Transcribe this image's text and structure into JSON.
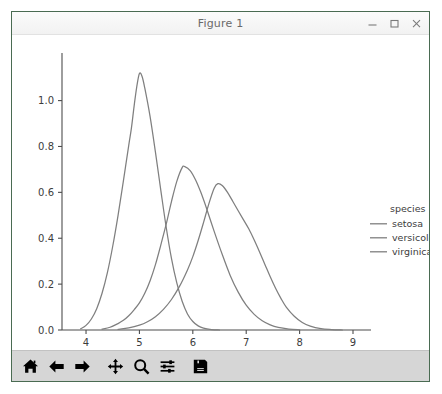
{
  "window": {
    "title": "Figure 1",
    "controls": [
      {
        "name": "minimize-button",
        "icon": "minimize-icon",
        "label": "–"
      },
      {
        "name": "maximize-button",
        "icon": "maximize-icon",
        "label": "□"
      },
      {
        "name": "close-button",
        "icon": "close-icon",
        "label": "×"
      }
    ]
  },
  "toolbar": {
    "buttons": [
      {
        "name": "home-button",
        "icon": "home-icon",
        "label": "Home"
      },
      {
        "name": "back-button",
        "icon": "arrow-left-icon",
        "label": "Back"
      },
      {
        "name": "forward-button",
        "icon": "arrow-right-icon",
        "label": "Forward"
      },
      {
        "name": "pan-button",
        "icon": "move-arrows-icon",
        "label": "Pan"
      },
      {
        "name": "zoom-button",
        "icon": "magnifier-icon",
        "label": "Zoom"
      },
      {
        "name": "configure-subplots-button",
        "icon": "sliders-icon",
        "label": "Configure subplots"
      },
      {
        "name": "save-button",
        "icon": "floppy-disk-icon",
        "label": "Save"
      }
    ]
  },
  "colors": {
    "curve": "#7f7f7f",
    "axis": "#4d4d4d",
    "text": "#3c3c3c",
    "window_border": "#4a6b52",
    "toolbar_bg": "#d6d6d6",
    "figure_bg": "#ffffff"
  },
  "chart_data": {
    "type": "line",
    "title": "",
    "xlabel": "sepal_length",
    "ylabel": "",
    "xlim": [
      3.55,
      9.0
    ],
    "ylim": [
      0.0,
      1.19
    ],
    "xticks": [
      4,
      5,
      6,
      7,
      8,
      9
    ],
    "xticklabels": [
      "4",
      "5",
      "6",
      "7",
      "8",
      "9"
    ],
    "yticks": [
      0.0,
      0.2,
      0.4,
      0.6,
      0.8,
      1.0
    ],
    "yticklabels": [
      "0.0",
      "0.2",
      "0.4",
      "0.6",
      "0.8",
      "1.0"
    ],
    "grid": false,
    "legend": {
      "title": "species",
      "position": "right",
      "entries": [
        "setosa",
        "versicolor",
        "virginica"
      ]
    },
    "series": [
      {
        "name": "setosa",
        "peak_x": 5.0,
        "peak_y": 1.12,
        "points": [
          [
            3.9,
            0.005
          ],
          [
            4.0,
            0.02
          ],
          [
            4.1,
            0.048
          ],
          [
            4.2,
            0.093
          ],
          [
            4.3,
            0.16
          ],
          [
            4.4,
            0.25
          ],
          [
            4.5,
            0.365
          ],
          [
            4.6,
            0.5
          ],
          [
            4.7,
            0.65
          ],
          [
            4.8,
            0.805
          ],
          [
            4.85,
            0.88
          ],
          [
            4.9,
            0.975
          ],
          [
            4.95,
            1.06
          ],
          [
            5.0,
            1.118
          ],
          [
            5.05,
            1.105
          ],
          [
            5.1,
            1.055
          ],
          [
            5.2,
            0.93
          ],
          [
            5.3,
            0.775
          ],
          [
            5.4,
            0.61
          ],
          [
            5.5,
            0.45
          ],
          [
            5.6,
            0.312
          ],
          [
            5.7,
            0.205
          ],
          [
            5.8,
            0.125
          ],
          [
            5.9,
            0.07
          ],
          [
            6.0,
            0.037
          ],
          [
            6.1,
            0.018
          ],
          [
            6.2,
            0.008
          ],
          [
            6.35,
            0.002
          ],
          [
            6.5,
            0.0
          ]
        ]
      },
      {
        "name": "versicolor",
        "peak_x": 5.82,
        "peak_y": 0.712,
        "points": [
          [
            4.3,
            0.004
          ],
          [
            4.45,
            0.012
          ],
          [
            4.6,
            0.028
          ],
          [
            4.7,
            0.042
          ],
          [
            4.8,
            0.062
          ],
          [
            4.9,
            0.088
          ],
          [
            5.0,
            0.118
          ],
          [
            5.1,
            0.16
          ],
          [
            5.2,
            0.215
          ],
          [
            5.3,
            0.285
          ],
          [
            5.4,
            0.37
          ],
          [
            5.5,
            0.46
          ],
          [
            5.6,
            0.56
          ],
          [
            5.7,
            0.648
          ],
          [
            5.8,
            0.708
          ],
          [
            5.85,
            0.712
          ],
          [
            5.95,
            0.695
          ],
          [
            6.05,
            0.655
          ],
          [
            6.15,
            0.6
          ],
          [
            6.25,
            0.535
          ],
          [
            6.4,
            0.43
          ],
          [
            6.55,
            0.33
          ],
          [
            6.7,
            0.238
          ],
          [
            6.85,
            0.165
          ],
          [
            7.0,
            0.108
          ],
          [
            7.15,
            0.068
          ],
          [
            7.3,
            0.04
          ],
          [
            7.45,
            0.022
          ],
          [
            7.6,
            0.011
          ],
          [
            7.8,
            0.004
          ],
          [
            8.0,
            0.001
          ]
        ]
      },
      {
        "name": "virginica",
        "peak_x": 6.45,
        "peak_y": 0.638,
        "points": [
          [
            4.6,
            0.003
          ],
          [
            4.8,
            0.009
          ],
          [
            5.0,
            0.021
          ],
          [
            5.15,
            0.036
          ],
          [
            5.3,
            0.058
          ],
          [
            5.45,
            0.09
          ],
          [
            5.6,
            0.133
          ],
          [
            5.75,
            0.19
          ],
          [
            5.9,
            0.262
          ],
          [
            6.0,
            0.32
          ],
          [
            6.1,
            0.39
          ],
          [
            6.2,
            0.468
          ],
          [
            6.3,
            0.55
          ],
          [
            6.4,
            0.618
          ],
          [
            6.47,
            0.638
          ],
          [
            6.55,
            0.63
          ],
          [
            6.65,
            0.6
          ],
          [
            6.75,
            0.56
          ],
          [
            6.85,
            0.52
          ],
          [
            6.95,
            0.48
          ],
          [
            7.05,
            0.44
          ],
          [
            7.15,
            0.392
          ],
          [
            7.25,
            0.34
          ],
          [
            7.35,
            0.286
          ],
          [
            7.45,
            0.232
          ],
          [
            7.55,
            0.182
          ],
          [
            7.65,
            0.138
          ],
          [
            7.75,
            0.1
          ],
          [
            7.9,
            0.06
          ],
          [
            8.05,
            0.033
          ],
          [
            8.2,
            0.017
          ],
          [
            8.4,
            0.006
          ],
          [
            8.6,
            0.002
          ],
          [
            8.8,
            0.0
          ]
        ]
      }
    ]
  }
}
